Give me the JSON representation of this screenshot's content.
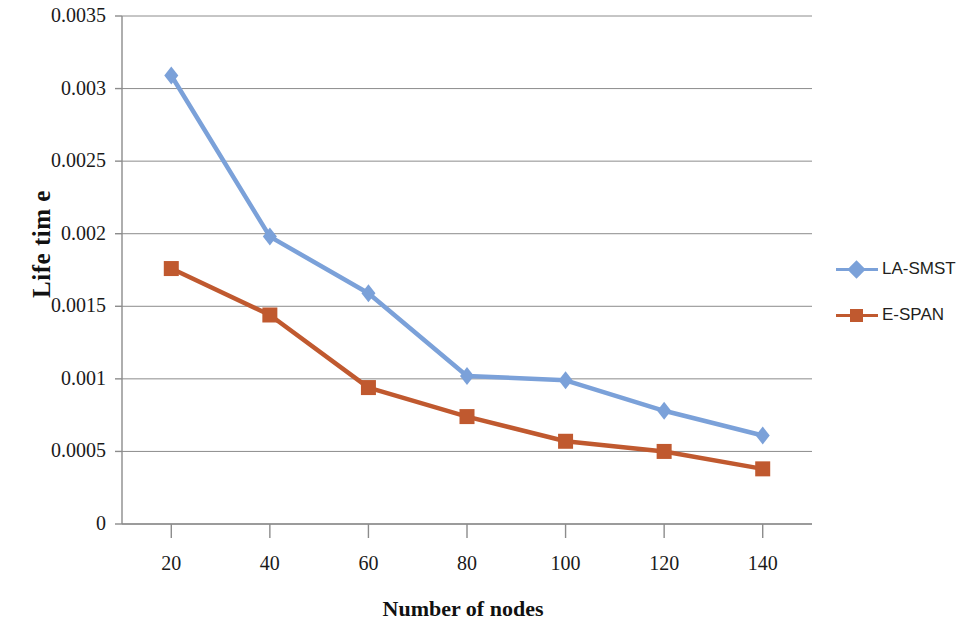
{
  "chart_data": {
    "type": "line",
    "title": "",
    "xlabel": "Number of nodes",
    "ylabel": "Life tim e",
    "x": [
      20,
      40,
      60,
      80,
      100,
      120,
      140
    ],
    "categories": [
      "20",
      "40",
      "60",
      "80",
      "100",
      "120",
      "140"
    ],
    "xlim": [
      10,
      150
    ],
    "ylim": [
      0,
      0.0035
    ],
    "yticks": [
      0,
      0.0005,
      0.001,
      0.0015,
      0.002,
      0.0025,
      0.003,
      0.0035
    ],
    "ytick_labels": [
      "0",
      "0.0005",
      "0.001",
      "0.0015",
      "0.002",
      "0.0025",
      "0.003",
      "0.0035"
    ],
    "grid": "horizontal",
    "legend_position": "right",
    "series": [
      {
        "name": "LA-SMST",
        "color": "#7ba1d9",
        "marker": "diamond",
        "values": [
          0.00309,
          0.00198,
          0.00159,
          0.00102,
          0.00099,
          0.00078,
          0.00061
        ]
      },
      {
        "name": "E-SPAN",
        "color": "#c0592f",
        "marker": "square",
        "values": [
          0.00176,
          0.00144,
          0.00094,
          0.00074,
          0.00057,
          0.0005,
          0.00038
        ]
      }
    ]
  },
  "axes": {
    "y_title": "Life tim e",
    "x_title": "Number of nodes"
  },
  "legend": {
    "items": [
      {
        "label": "LA-SMST",
        "color": "#7ba1d9",
        "marker": "diamond"
      },
      {
        "label": "E-SPAN",
        "color": "#c0592f",
        "marker": "square"
      }
    ]
  },
  "colors": {
    "series1": "#7ba1d9",
    "series2": "#c0592f",
    "grid": "#8c8c8c",
    "axis": "#8c8c8c",
    "text": "#1a1a1a"
  }
}
